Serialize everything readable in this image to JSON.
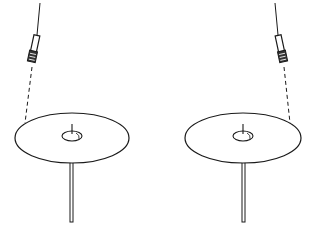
{
  "figure": {
    "colors": {
      "background": "#ffffff",
      "line": "#1a1a1a",
      "fill": "#ffffff"
    },
    "items": [
      {
        "id": "left",
        "pad": {
          "cx": 72,
          "cy": 138,
          "rx": 57,
          "ry": 25
        },
        "bell": {
          "cx": 72,
          "cy": 136,
          "rx": 10,
          "ry": 5
        },
        "stand": {
          "x": 71.5,
          "y1": 163,
          "y2": 222
        },
        "cable": {
          "x1": 40,
          "y1": 3,
          "x2": 37,
          "y2": 35
        },
        "plug": {
          "x": 31,
          "y": 35,
          "w": 7,
          "h": 28,
          "angle": 12
        },
        "dashed_link": {
          "x1": 32,
          "y1": 68,
          "x2": 25,
          "y2": 123
        }
      },
      {
        "id": "right",
        "pad": {
          "cx": 243,
          "cy": 138,
          "rx": 58,
          "ry": 25
        },
        "bell": {
          "cx": 243,
          "cy": 136,
          "rx": 10,
          "ry": 5
        },
        "stand": {
          "x": 243.5,
          "y1": 163,
          "y2": 222
        },
        "cable": {
          "x1": 275,
          "y1": 3,
          "x2": 278,
          "y2": 35
        },
        "plug": {
          "x": 278,
          "y": 35,
          "w": 7,
          "h": 28,
          "angle": -12
        },
        "dashed_link": {
          "x1": 284,
          "y1": 68,
          "x2": 290,
          "y2": 123
        }
      }
    ]
  }
}
